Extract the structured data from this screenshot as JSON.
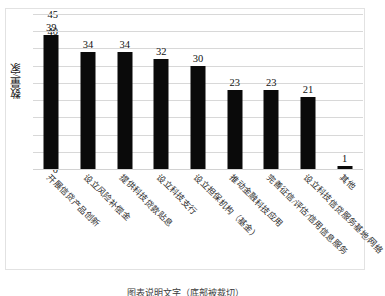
{
  "chart_data": {
    "type": "bar",
    "title": "",
    "xlabel": "",
    "ylabel": "数量/家",
    "ylim": [
      0,
      45
    ],
    "ytick_step": 5,
    "yticks": [
      45,
      40,
      35,
      30,
      25,
      20,
      15,
      10,
      5,
      0
    ],
    "grid": true,
    "legend": "none",
    "bar_color": "#0a0a0a",
    "gridline_color": "#d8d8d8",
    "categories": [
      "开展信贷产品创新",
      "设立风险补偿金",
      "提供科技贷款贴息",
      "设立科技支行",
      "设立担保机构（基金）",
      "推动金融科技应用",
      "完善征信/评估/信用信息服务",
      "设立科技信贷服务基地/网络",
      "其他"
    ],
    "values": [
      39,
      34,
      34,
      32,
      30,
      23,
      23,
      21,
      1
    ],
    "data_labels": [
      "39",
      "34",
      "34",
      "32",
      "30",
      "23",
      "23",
      "21",
      "1"
    ]
  },
  "caption": {
    "text": "图表说明文字（底部被裁切）"
  }
}
